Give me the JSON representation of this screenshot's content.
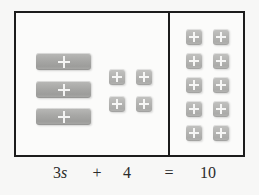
{
  "diagram": {
    "equation": {
      "left_variable_term": "3s",
      "left_coefficient": "3",
      "left_variable": "s",
      "operator_plus": "+",
      "left_constant": "4",
      "operator_equals": "=",
      "right_value": "10",
      "full": "3s + 4 = 10"
    },
    "left_panel": {
      "variable_tiles": [
        {
          "label": "s",
          "icon": "plus-icon",
          "x": 36,
          "y": 53
        },
        {
          "label": "s",
          "icon": "plus-icon",
          "x": 36,
          "y": 81
        },
        {
          "label": "s",
          "icon": "plus-icon",
          "x": 36,
          "y": 108
        }
      ],
      "unit_tiles": [
        {
          "label": "1",
          "icon": "plus-icon",
          "x": 109,
          "y": 69
        },
        {
          "label": "1",
          "icon": "plus-icon",
          "x": 136,
          "y": 69
        },
        {
          "label": "1",
          "icon": "plus-icon",
          "x": 109,
          "y": 96
        },
        {
          "label": "1",
          "icon": "plus-icon",
          "x": 136,
          "y": 96
        }
      ]
    },
    "right_panel": {
      "unit_tiles": [
        {
          "label": "1",
          "icon": "plus-icon",
          "x": 186,
          "y": 29
        },
        {
          "label": "1",
          "icon": "plus-icon",
          "x": 213,
          "y": 29
        },
        {
          "label": "1",
          "icon": "plus-icon",
          "x": 186,
          "y": 53
        },
        {
          "label": "1",
          "icon": "plus-icon",
          "x": 213,
          "y": 53
        },
        {
          "label": "1",
          "icon": "plus-icon",
          "x": 186,
          "y": 77
        },
        {
          "label": "1",
          "icon": "plus-icon",
          "x": 213,
          "y": 77
        },
        {
          "label": "1",
          "icon": "plus-icon",
          "x": 186,
          "y": 101
        },
        {
          "label": "1",
          "icon": "plus-icon",
          "x": 213,
          "y": 101
        },
        {
          "label": "1",
          "icon": "plus-icon",
          "x": 186,
          "y": 125
        },
        {
          "label": "1",
          "icon": "plus-icon",
          "x": 213,
          "y": 125
        }
      ]
    },
    "colors": {
      "background": "#f7f7f6",
      "box_fill": "#fbfbfa",
      "border": "#1c1c1c",
      "bar_tile": "#a7a7a5",
      "unit_tile": "#b3b3b1",
      "plus_mark": "#f5f5f4",
      "text": "#2b2b2b"
    }
  }
}
